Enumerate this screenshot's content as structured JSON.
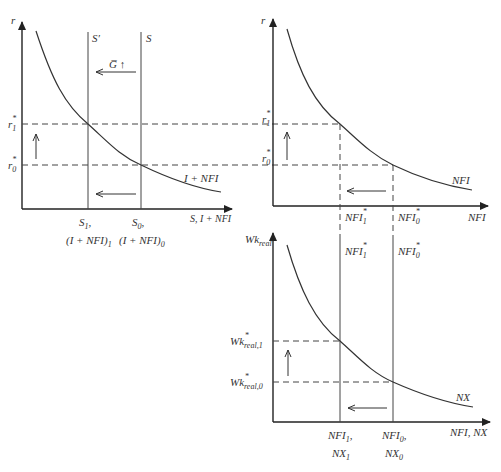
{
  "diagram": {
    "type": "economics-three-panel",
    "panel_savings_investment": {
      "y_axis_label": "r",
      "x_axis_label": "S, I + NFI",
      "curves": {
        "demand": "I + NFI",
        "supply_new": "S′",
        "supply_old": "S"
      },
      "policy_label": "G̅ ↑",
      "y_ticks": {
        "r1": "r",
        "r1_sub": "1",
        "r0": "r",
        "r0_sub": "0",
        "star": "*"
      },
      "x_ticks": [
        {
          "line1": "S",
          "sub1": "1",
          "tail1": ",",
          "line2": "(I + NFI)",
          "sub2": "1"
        },
        {
          "line1": "S",
          "sub1": "0",
          "tail1": ",",
          "line2": "(I + NFI)",
          "sub2": "0"
        }
      ]
    },
    "panel_nfi": {
      "y_axis_label": "r",
      "x_axis_label": "NFI",
      "curve_label": "NFI",
      "y_ticks": {
        "r1": "r",
        "r1_sub": "1",
        "r0": "r",
        "r0_sub": "0",
        "star": "*"
      },
      "x_ticks": [
        {
          "label": "NFI",
          "sub": "1"
        },
        {
          "label": "NFI",
          "sub": "0"
        }
      ]
    },
    "panel_exchange": {
      "y_axis_label": "Wk",
      "y_axis_sub": "real",
      "x_axis_label": "NFI, NX",
      "curve_label": "NX",
      "top_ticks": [
        {
          "label": "NFI",
          "sub": "1"
        },
        {
          "label": "NFI",
          "sub": "0"
        }
      ],
      "y_ticks": [
        {
          "label": "Wk",
          "sub": "real,1"
        },
        {
          "label": "Wk",
          "sub": "real,0"
        }
      ],
      "x_ticks": [
        {
          "line1": "NFI",
          "sub1": "1",
          "tail1": ",",
          "line2": "NX",
          "sub2": "1"
        },
        {
          "line1": "NFI",
          "sub1": "0",
          "tail1": ",",
          "line2": "NX",
          "sub2": "0"
        }
      ]
    }
  }
}
